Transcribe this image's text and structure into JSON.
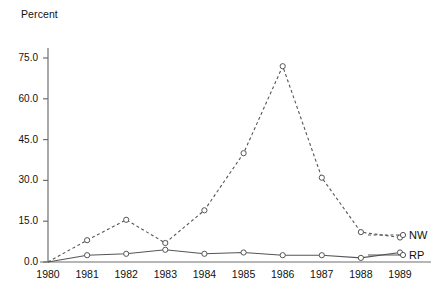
{
  "chart_data": {
    "type": "line",
    "title": "",
    "xlabel": "",
    "ylabel": "Percent",
    "categories": [
      "1980",
      "1981",
      "1982",
      "1983",
      "1984",
      "1985",
      "1986",
      "1987",
      "1988",
      "1989"
    ],
    "x": [
      1980,
      1981,
      1982,
      1983,
      1984,
      1985,
      1986,
      1987,
      1988,
      1989
    ],
    "series": [
      {
        "name": "NW",
        "style": "dashed",
        "marker": "open-circle",
        "color": "#555555",
        "values": [
          0,
          8,
          15.5,
          7,
          19,
          40,
          72,
          31,
          11,
          9
        ]
      },
      {
        "name": "RP",
        "style": "solid",
        "marker": "open-circle",
        "color": "#555555",
        "values": [
          0,
          2.5,
          3,
          4.5,
          3,
          3.5,
          2.5,
          2.5,
          1.5,
          3.5
        ]
      }
    ],
    "ylim": [
      0,
      78
    ],
    "xlim": [
      1980,
      1989
    ],
    "yticks": [
      0,
      15,
      30,
      45,
      60,
      75
    ],
    "ytick_labels": [
      "0.0",
      "15.0",
      "30.0",
      "45.0",
      "60.0",
      "75.0"
    ],
    "xtick_labels": [
      "1980",
      "1981",
      "1982",
      "1983",
      "1984",
      "1985",
      "1986",
      "1987",
      "1988",
      "1989"
    ],
    "grid": false,
    "legend_position": "right-inline",
    "legend": [
      "NW",
      "RP"
    ]
  },
  "axis": {
    "y_title": "Percent"
  },
  "legend": {
    "nw_label": "NW",
    "rp_label": "RP"
  },
  "caption": {
    "text": ""
  }
}
